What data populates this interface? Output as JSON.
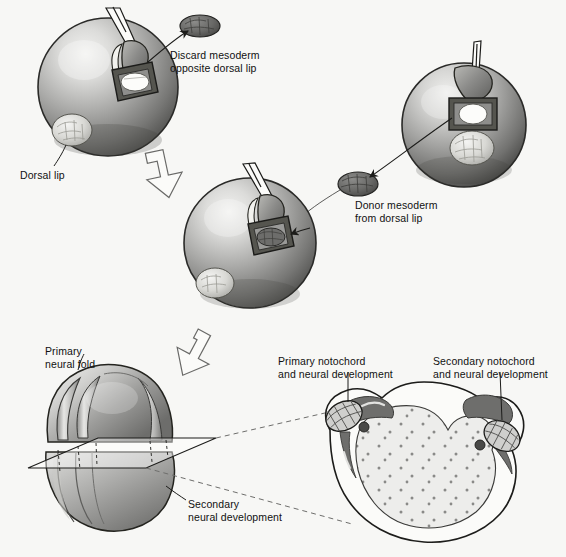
{
  "figure": {
    "background_color": "#f7f7f5",
    "ink_color": "#111111"
  },
  "labels": {
    "discard": "Discard mesoderm\nopposite dorsal lip",
    "dorsal_lip": "Dorsal lip",
    "donor": "Donor mesoderm\nfrom dorsal lip",
    "primary_neural_fold": "Primary\nneural fold",
    "secondary_neural": "Secondary\nneural development",
    "primary_notochord": "Primary notochord\nand neural development",
    "secondary_notochord": "Secondary notochord\nand neural development"
  },
  "panels": [
    {
      "id": "host-embryo",
      "name": "Host embryo with mesoderm removed opposite dorsal lip",
      "role": "host",
      "position": "top-left"
    },
    {
      "id": "donor-embryo",
      "name": "Donor embryo with dorsal lip mesoderm being excised",
      "role": "donor",
      "position": "top-right"
    },
    {
      "id": "grafted-embryo",
      "name": "Host embryo after donor mesoderm graft",
      "role": "graft",
      "position": "middle"
    },
    {
      "id": "neurula-embryo",
      "name": "Neurula stage embryo with primary and secondary neural folds",
      "role": "result",
      "position": "bottom-left"
    },
    {
      "id": "cross-section",
      "name": "Transverse section showing twin notochords and neural tubes",
      "role": "section",
      "position": "bottom-right"
    }
  ],
  "colors": {
    "sphere_light": "#e8e8e6",
    "sphere_mid": "#9a9a98",
    "sphere_dark": "#5e5e5c",
    "sphere_edge": "#2e2e2c",
    "tissue_dark": "#6e6e6c",
    "tissue_light": "#d6d6d2",
    "notochord": "#6e6e6c",
    "yolk": "#ececea",
    "outline": "#1c1c1a"
  }
}
